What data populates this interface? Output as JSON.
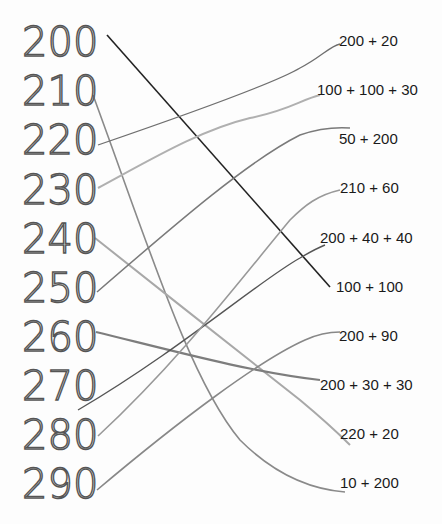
{
  "worksheet": {
    "left_numbers": [
      {
        "value": "200",
        "y": 22
      },
      {
        "value": "210",
        "y": 71
      },
      {
        "value": "220",
        "y": 120
      },
      {
        "value": "230",
        "y": 170
      },
      {
        "value": "240",
        "y": 219
      },
      {
        "value": "250",
        "y": 268
      },
      {
        "value": "260",
        "y": 317
      },
      {
        "value": "270",
        "y": 366
      },
      {
        "value": "280",
        "y": 415
      },
      {
        "value": "290",
        "y": 464
      }
    ],
    "right_expressions": [
      {
        "text": "200 + 20",
        "x": 339,
        "y": 32
      },
      {
        "text": "100 + 100 + 30",
        "x": 317,
        "y": 81
      },
      {
        "text": "50 + 200",
        "x": 339,
        "y": 130
      },
      {
        "text": "210 + 60",
        "x": 340,
        "y": 179
      },
      {
        "text": "200 + 40 + 40",
        "x": 320,
        "y": 229
      },
      {
        "text": "100 + 100",
        "x": 336,
        "y": 278
      },
      {
        "text": "200 + 90",
        "x": 339,
        "y": 327
      },
      {
        "text": "200 + 30 + 30",
        "x": 320,
        "y": 376
      },
      {
        "text": "220 + 20",
        "x": 340,
        "y": 425
      },
      {
        "text": "10 + 200",
        "x": 340,
        "y": 474
      }
    ],
    "matches": [
      {
        "from": "200",
        "to": "100 + 100"
      },
      {
        "from": "210",
        "to": "10 + 200"
      },
      {
        "from": "220",
        "to": "200 + 20"
      },
      {
        "from": "230",
        "to": "100 + 100 + 30"
      },
      {
        "from": "240",
        "to": "220 + 20"
      },
      {
        "from": "250",
        "to": "50 + 200"
      },
      {
        "from": "260",
        "to": "200 + 30 + 30"
      },
      {
        "from": "270",
        "to": "200 + 40 + 40"
      },
      {
        "from": "280",
        "to": "210 + 60"
      },
      {
        "from": "290",
        "to": "200 + 90"
      }
    ],
    "line_colors": {
      "dark": "#222222",
      "pencil": "#8a8a8a",
      "light": "#b0b0b0"
    }
  }
}
